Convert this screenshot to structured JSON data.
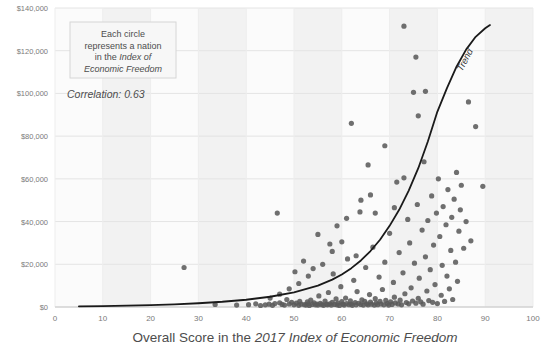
{
  "chart_data": {
    "type": "scatter",
    "title": "",
    "xlabel_parts": [
      {
        "text": "Overall Score in the ",
        "italic": false
      },
      {
        "text": "2017 Index of Economic Freedom",
        "italic": true
      }
    ],
    "xlabel": "Overall Score in the 2017 Index of Economic Freedom",
    "ylabel": "",
    "xlim": [
      0,
      100
    ],
    "ylim": [
      0,
      140000
    ],
    "xticks": [
      0,
      10,
      20,
      30,
      40,
      50,
      60,
      70,
      80,
      90,
      100
    ],
    "xticklabels": [
      "0",
      "10",
      "20",
      "30",
      "40",
      "50",
      "60",
      "70",
      "80",
      "90",
      "100"
    ],
    "yticks": [
      0,
      20000,
      40000,
      60000,
      80000,
      100000,
      120000,
      140000
    ],
    "yticklabels": [
      "$0",
      "$20,000",
      "$40,000",
      "$60,000",
      "$80,000",
      "$100,000",
      "$120,000",
      "$140,000"
    ],
    "grid": "horizontal-light-plus-vertical-bands",
    "legend": "none",
    "marker_color": "#5b5b5b",
    "trend_color": "#1a1a1a",
    "correlation": 0.63,
    "annotations": {
      "callout_lines": [
        {
          "text": "Each circle",
          "italic": false
        },
        {
          "text": "represents a nation",
          "italic": false
        },
        {
          "text": "in the ",
          "italic": false,
          "tail": "Index of",
          "tail_italic": true
        },
        {
          "text": "Economic Freedom",
          "italic": true
        }
      ],
      "callout_text": "Each circle represents a nation in the Index of Economic Freedom",
      "correlation_text": "Correlation: 0.63",
      "trend_label": "Trend"
    },
    "trend": {
      "form": "exponential",
      "x_start": 5,
      "x_end": 91,
      "points": [
        [
          5,
          300
        ],
        [
          10,
          450
        ],
        [
          15,
          650
        ],
        [
          20,
          900
        ],
        [
          25,
          1250
        ],
        [
          30,
          1750
        ],
        [
          35,
          2450
        ],
        [
          40,
          3400
        ],
        [
          45,
          4800
        ],
        [
          50,
          6900
        ],
        [
          55,
          10000
        ],
        [
          58,
          12800
        ],
        [
          60,
          15200
        ],
        [
          62,
          18200
        ],
        [
          64,
          21800
        ],
        [
          66,
          26200
        ],
        [
          68,
          31500
        ],
        [
          70,
          38000
        ],
        [
          72,
          45500
        ],
        [
          74,
          54500
        ],
        [
          76,
          65000
        ],
        [
          78,
          77500
        ],
        [
          80,
          91500
        ],
        [
          82,
          102500
        ],
        [
          84,
          112500
        ],
        [
          86,
          120500
        ],
        [
          88,
          126500
        ],
        [
          90,
          130500
        ],
        [
          91,
          132000
        ]
      ]
    },
    "points": [
      [
        27.0,
        18500
      ],
      [
        33.5,
        1200
      ],
      [
        38.0,
        900
      ],
      [
        40.5,
        1100
      ],
      [
        42.0,
        1500
      ],
      [
        43.0,
        700
      ],
      [
        44.0,
        1000
      ],
      [
        44.8,
        1300
      ],
      [
        45.5,
        800
      ],
      [
        46.0,
        1600
      ],
      [
        46.5,
        44000
      ],
      [
        47.0,
        2000
      ],
      [
        47.5,
        1200
      ],
      [
        48.0,
        900
      ],
      [
        48.5,
        3500
      ],
      [
        49.0,
        1400
      ],
      [
        49.5,
        2200
      ],
      [
        50.0,
        1000
      ],
      [
        50.2,
        16500
      ],
      [
        50.5,
        1800
      ],
      [
        51.0,
        800
      ],
      [
        51.2,
        2600
      ],
      [
        51.5,
        1300
      ],
      [
        52.0,
        21500
      ],
      [
        52.2,
        1100
      ],
      [
        52.5,
        900
      ],
      [
        52.8,
        2400
      ],
      [
        53.0,
        1500
      ],
      [
        53.2,
        700
      ],
      [
        53.5,
        3200
      ],
      [
        53.8,
        1200
      ],
      [
        54.0,
        18000
      ],
      [
        54.2,
        2000
      ],
      [
        54.5,
        1000
      ],
      [
        54.8,
        1400
      ],
      [
        55.0,
        900
      ],
      [
        55.2,
        5200
      ],
      [
        55.5,
        1700
      ],
      [
        55.8,
        1100
      ],
      [
        56.0,
        20000
      ],
      [
        56.2,
        800
      ],
      [
        56.5,
        2800
      ],
      [
        56.8,
        1300
      ],
      [
        57.0,
        1000
      ],
      [
        57.2,
        6800
      ],
      [
        57.5,
        1500
      ],
      [
        57.8,
        900
      ],
      [
        58.0,
        2200
      ],
      [
        58.2,
        15500
      ],
      [
        58.5,
        1200
      ],
      [
        58.8,
        3800
      ],
      [
        59.0,
        1000
      ],
      [
        59.2,
        1800
      ],
      [
        59.5,
        700
      ],
      [
        59.8,
        9500
      ],
      [
        60.0,
        2500
      ],
      [
        60.2,
        1300
      ],
      [
        60.5,
        900
      ],
      [
        60.8,
        4200
      ],
      [
        61.0,
        1600
      ],
      [
        61.2,
        22500
      ],
      [
        61.5,
        1100
      ],
      [
        61.8,
        2900
      ],
      [
        62.0,
        1400
      ],
      [
        62.2,
        800
      ],
      [
        62.5,
        12500
      ],
      [
        62.8,
        2100
      ],
      [
        63.0,
        1000
      ],
      [
        63.2,
        7200
      ],
      [
        63.5,
        1700
      ],
      [
        63.8,
        44500
      ],
      [
        64.0,
        1200
      ],
      [
        64.2,
        3400
      ],
      [
        64.5,
        900
      ],
      [
        64.8,
        2600
      ],
      [
        65.0,
        18500
      ],
      [
        65.2,
        1500
      ],
      [
        65.5,
        1000
      ],
      [
        65.8,
        5800
      ],
      [
        66.0,
        2300
      ],
      [
        66.2,
        1300
      ],
      [
        66.5,
        28000
      ],
      [
        66.8,
        900
      ],
      [
        67.0,
        3900
      ],
      [
        67.2,
        1800
      ],
      [
        67.5,
        1100
      ],
      [
        67.8,
        14000
      ],
      [
        68.0,
        2700
      ],
      [
        68.2,
        1400
      ],
      [
        68.5,
        8200
      ],
      [
        68.8,
        1000
      ],
      [
        69.0,
        21000
      ],
      [
        69.2,
        3100
      ],
      [
        69.5,
        1600
      ],
      [
        69.8,
        900
      ],
      [
        70.0,
        34500
      ],
      [
        70.2,
        2400
      ],
      [
        70.5,
        1200
      ],
      [
        70.8,
        11500
      ],
      [
        71.0,
        4600
      ],
      [
        71.2,
        1900
      ],
      [
        71.5,
        58500
      ],
      [
        71.8,
        1400
      ],
      [
        72.0,
        25500
      ],
      [
        72.2,
        3200
      ],
      [
        72.5,
        1000
      ],
      [
        72.8,
        16000
      ],
      [
        73.0,
        131500
      ],
      [
        73.2,
        6200
      ],
      [
        73.5,
        2100
      ],
      [
        73.8,
        41000
      ],
      [
        74.0,
        1500
      ],
      [
        74.2,
        30000
      ],
      [
        74.5,
        9000
      ],
      [
        74.8,
        2800
      ],
      [
        75.0,
        100500
      ],
      [
        75.2,
        20500
      ],
      [
        75.5,
        1800
      ],
      [
        75.8,
        48000
      ],
      [
        76.0,
        4100
      ],
      [
        76.2,
        13500
      ],
      [
        76.5,
        2400
      ],
      [
        76.8,
        36000
      ],
      [
        77.0,
        1300
      ],
      [
        77.2,
        68000
      ],
      [
        77.5,
        23500
      ],
      [
        77.8,
        7500
      ],
      [
        78.0,
        40500
      ],
      [
        78.2,
        3000
      ],
      [
        78.5,
        17500
      ],
      [
        78.8,
        52000
      ],
      [
        79.0,
        2200
      ],
      [
        79.2,
        29000
      ],
      [
        79.5,
        10500
      ],
      [
        79.8,
        44000
      ],
      [
        80.0,
        1600
      ],
      [
        80.2,
        60000
      ],
      [
        80.5,
        33000
      ],
      [
        80.8,
        5500
      ],
      [
        81.0,
        19500
      ],
      [
        81.2,
        47000
      ],
      [
        81.5,
        2600
      ],
      [
        81.8,
        38500
      ],
      [
        82.0,
        14500
      ],
      [
        82.2,
        55000
      ],
      [
        82.5,
        8500
      ],
      [
        82.8,
        26500
      ],
      [
        83.0,
        42000
      ],
      [
        83.2,
        3500
      ],
      [
        83.5,
        50500
      ],
      [
        83.8,
        21000
      ],
      [
        84.0,
        63000
      ],
      [
        84.2,
        12000
      ],
      [
        84.5,
        35500
      ],
      [
        84.8,
        45500
      ],
      [
        85.0,
        57000
      ],
      [
        85.5,
        27500
      ],
      [
        86.0,
        40000
      ],
      [
        86.5,
        96000
      ],
      [
        87.0,
        31000
      ],
      [
        88.0,
        84500
      ],
      [
        89.5,
        56500
      ],
      [
        76.0,
        89500
      ],
      [
        77.5,
        101000
      ],
      [
        75.5,
        117000
      ],
      [
        62.0,
        86000
      ],
      [
        65.5,
        66500
      ],
      [
        69.0,
        75500
      ],
      [
        66.0,
        52500
      ],
      [
        59.0,
        38000
      ],
      [
        57.5,
        29500
      ],
      [
        55.0,
        34000
      ],
      [
        61.0,
        41500
      ],
      [
        63.0,
        24000
      ],
      [
        58.0,
        26000
      ],
      [
        53.0,
        14500
      ],
      [
        51.0,
        11000
      ],
      [
        49.0,
        8500
      ],
      [
        47.0,
        6000
      ],
      [
        45.0,
        4200
      ],
      [
        71.0,
        46500
      ],
      [
        73.0,
        60500
      ],
      [
        67.0,
        44000
      ],
      [
        64.0,
        50000
      ],
      [
        60.0,
        30500
      ]
    ]
  }
}
